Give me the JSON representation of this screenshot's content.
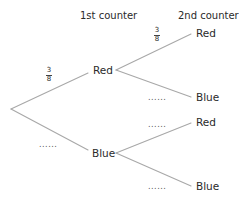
{
  "headers": {
    "first": "1st counter",
    "second": "2nd counter"
  },
  "tree": {
    "first_level": [
      {
        "label": "Red",
        "probability": {
          "numerator": "3",
          "denominator": "8"
        }
      },
      {
        "label": "Blue",
        "probability_placeholder": "......"
      }
    ],
    "second_level": {
      "after_red": [
        {
          "label": "Red",
          "probability": {
            "numerator": "3",
            "denominator": "8"
          }
        },
        {
          "label": "Blue",
          "probability_placeholder": "......"
        }
      ],
      "after_blue": [
        {
          "label": "Red",
          "probability_placeholder": "......"
        },
        {
          "label": "Blue",
          "probability_placeholder": "......"
        }
      ]
    }
  },
  "colors": {
    "line": "#a8a8a8",
    "text": "#2a2a2a"
  }
}
